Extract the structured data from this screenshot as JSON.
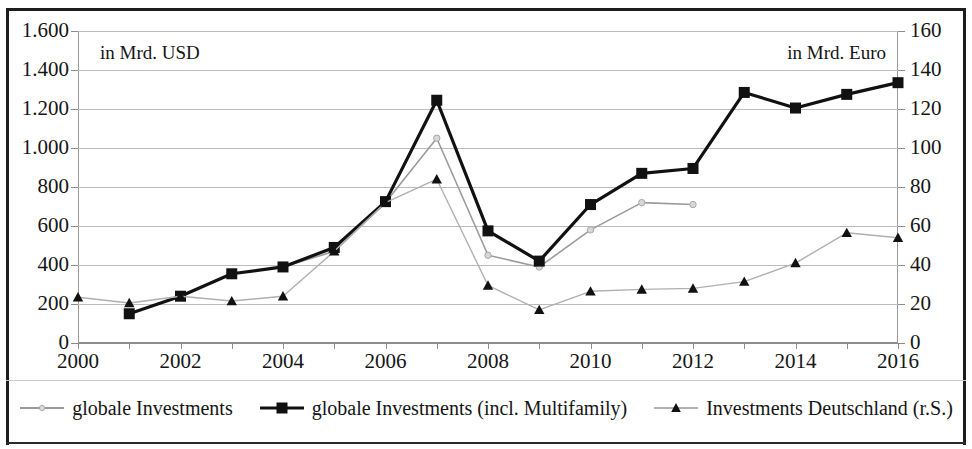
{
  "figure": {
    "left_axis_note": "in Mrd. USD",
    "right_axis_note": "in Mrd. Euro"
  },
  "legend": {
    "items": [
      {
        "label": "globale Investments",
        "marker": "small-dot-marker",
        "color": "#9b9b9b"
      },
      {
        "label": "globale Investments (incl. Multifamily)",
        "marker": "filled-square-marker",
        "color": "#111111"
      },
      {
        "label": "Investments  Deutschland (r.S.)",
        "marker": "filled-triangle-marker",
        "color": "#b0b0b0"
      }
    ]
  },
  "chart_data": {
    "type": "line",
    "title": "",
    "xlabel": "",
    "ylabel": "in Mrd. USD",
    "y2label": "in Mrd. Euro",
    "grid": true,
    "legend_position": "bottom",
    "x": [
      2000,
      2001,
      2002,
      2003,
      2004,
      2005,
      2006,
      2007,
      2008,
      2009,
      2010,
      2011,
      2012,
      2013,
      2014,
      2015,
      2016
    ],
    "xtick_labels": [
      "2000",
      "2002",
      "2004",
      "2006",
      "2008",
      "2010",
      "2012",
      "2014",
      "2016"
    ],
    "xtick_values": [
      2000,
      2002,
      2004,
      2006,
      2008,
      2010,
      2012,
      2014,
      2016
    ],
    "xlim": [
      2000,
      2016
    ],
    "ylim": [
      0,
      1600
    ],
    "ytick_values": [
      0,
      200,
      400,
      600,
      800,
      1000,
      1200,
      1400,
      1600
    ],
    "ytick_labels": [
      "0",
      "200",
      "400",
      "600",
      "800",
      "1.000",
      "1.200",
      "1.400",
      "1.600"
    ],
    "y2lim": [
      0,
      160
    ],
    "y2tick_values": [
      0,
      20,
      40,
      60,
      80,
      100,
      120,
      140,
      160
    ],
    "y2tick_labels": [
      "0",
      "20",
      "40",
      "60",
      "80",
      "100",
      "120",
      "140",
      "160"
    ],
    "series": [
      {
        "name": "globale Investments",
        "axis": "left",
        "color": "#9b9b9b",
        "marker": "small-dot-marker",
        "x": [
          2001,
          2002,
          2003,
          2004,
          2005,
          2006,
          2007,
          2008,
          2009,
          2010,
          2011,
          2012
        ],
        "values": [
          150,
          240,
          355,
          390,
          470,
          720,
          1050,
          450,
          390,
          580,
          720,
          710
        ]
      },
      {
        "name": "globale Investments (incl. Multifamily)",
        "axis": "left",
        "color": "#111111",
        "marker": "filled-square-marker",
        "x": [
          2001,
          2002,
          2003,
          2004,
          2005,
          2006,
          2007,
          2008,
          2009,
          2010,
          2011,
          2012,
          2013,
          2014,
          2015,
          2016
        ],
        "values": [
          150,
          240,
          355,
          390,
          490,
          725,
          1245,
          575,
          420,
          710,
          870,
          895,
          1285,
          1205,
          1275,
          1335
        ]
      },
      {
        "name": "Investments  Deutschland (r.S.)",
        "axis": "right",
        "color": "#b0b0b0",
        "marker": "filled-triangle-marker",
        "x": [
          2000,
          2001,
          2002,
          2003,
          2004,
          2005,
          2006,
          2007,
          2008,
          2009,
          2010,
          2011,
          2012,
          2013,
          2014,
          2015,
          2016
        ],
        "values": [
          23.5,
          20.5,
          24,
          21.5,
          24,
          47,
          72,
          84,
          29.5,
          17,
          26.5,
          27.5,
          28,
          31.5,
          41,
          56.5,
          54
        ]
      }
    ]
  }
}
